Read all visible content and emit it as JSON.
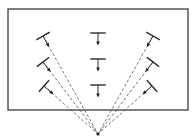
{
  "diagram": {
    "frame": {
      "x": 8,
      "y": 9,
      "width": 180,
      "height": 101
    },
    "focal_point": {
      "x": 98,
      "y": 134
    },
    "columns": [
      {
        "name": "left",
        "symbols": [
          {
            "x": 43,
            "y": 36,
            "angle": -29
          },
          {
            "x": 43,
            "y": 62,
            "angle": -37
          },
          {
            "x": 44,
            "y": 86,
            "angle": -48
          }
        ]
      },
      {
        "name": "center",
        "symbols": [
          {
            "x": 98,
            "y": 33,
            "angle": 0
          },
          {
            "x": 98,
            "y": 59,
            "angle": 0
          },
          {
            "x": 98,
            "y": 85,
            "angle": 0
          }
        ]
      },
      {
        "name": "right",
        "symbols": [
          {
            "x": 153,
            "y": 36,
            "angle": 29
          },
          {
            "x": 153,
            "y": 62,
            "angle": 37
          },
          {
            "x": 152,
            "y": 86,
            "angle": 48
          }
        ]
      }
    ],
    "colors": {
      "line": "#2a2a2a",
      "ray": "#555555",
      "background": "#ffffff"
    }
  }
}
